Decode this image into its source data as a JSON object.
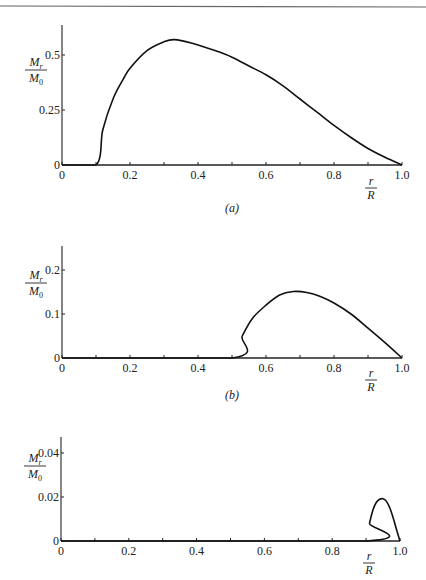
{
  "figure": {
    "top_rule": true,
    "ylabel_numerator": "M",
    "ylabel_numerator_sub": "r",
    "ylabel_denominator": "M",
    "ylabel_denominator_sub": "0",
    "xlabel_numerator": "r",
    "xlabel_denominator": "R"
  },
  "chart_data": [
    {
      "type": "line",
      "panel": "(a)",
      "title": "",
      "xlabel": "r/R",
      "ylabel": "M_r/M_0",
      "xlim": [
        0,
        1.0
      ],
      "ylim": [
        0,
        0.64
      ],
      "xticks": [
        0,
        0.2,
        0.4,
        0.6,
        0.8,
        1.0
      ],
      "xtick_labels": [
        "0",
        "0.2",
        "0.4",
        "0.6",
        "0.8",
        "1.0"
      ],
      "xminor_ticks": [
        0.1,
        0.3,
        0.5,
        0.7,
        0.9
      ],
      "yticks": [
        0,
        0.25,
        0.5
      ],
      "ytick_labels": [
        "0",
        "0.25",
        "0.5"
      ],
      "grid": false,
      "x": [
        0.0,
        0.1,
        0.12,
        0.15,
        0.18,
        0.2,
        0.25,
        0.3,
        0.33,
        0.38,
        0.45,
        0.5,
        0.55,
        0.6,
        0.65,
        0.7,
        0.75,
        0.8,
        0.85,
        0.9,
        0.95,
        1.0
      ],
      "values": [
        0.0,
        0.0,
        0.16,
        0.3,
        0.39,
        0.44,
        0.52,
        0.56,
        0.57,
        0.555,
        0.52,
        0.49,
        0.45,
        0.41,
        0.36,
        0.3,
        0.24,
        0.18,
        0.125,
        0.075,
        0.035,
        0.0
      ]
    },
    {
      "type": "line",
      "panel": "(b)",
      "title": "",
      "xlabel": "r/R",
      "ylabel": "M_r/M_0",
      "xlim": [
        0,
        1.0
      ],
      "ylim": [
        0,
        0.255
      ],
      "xticks": [
        0,
        0.2,
        0.4,
        0.6,
        0.8,
        1.0
      ],
      "xtick_labels": [
        "0",
        "0.2",
        "0.4",
        "0.6",
        "0.8",
        "1.0"
      ],
      "xminor_ticks": [
        0.1,
        0.3,
        0.5,
        0.7,
        0.9
      ],
      "yticks": [
        0,
        0.1,
        0.2
      ],
      "ytick_labels": [
        "0",
        "0.1",
        "0.2"
      ],
      "grid": false,
      "x": [
        0.0,
        0.5,
        0.53,
        0.56,
        0.6,
        0.64,
        0.68,
        0.72,
        0.76,
        0.8,
        0.85,
        0.9,
        0.95,
        1.0
      ],
      "values": [
        0.0,
        0.0,
        0.05,
        0.09,
        0.12,
        0.143,
        0.151,
        0.149,
        0.14,
        0.125,
        0.1,
        0.068,
        0.035,
        0.0
      ]
    },
    {
      "type": "line",
      "panel": "(c)",
      "title": "",
      "xlabel": "r/R",
      "ylabel": "M_r/M_0",
      "xlim": [
        0,
        1.0
      ],
      "ylim": [
        0,
        0.047
      ],
      "xticks": [
        0,
        0.2,
        0.4,
        0.6,
        0.8,
        1.0
      ],
      "xtick_labels": [
        "0",
        "0.2",
        "0.4",
        "0.6",
        "0.8",
        "1.0"
      ],
      "xminor_ticks": [
        0.1,
        0.3,
        0.5,
        0.7,
        0.9
      ],
      "yticks": [
        0,
        0.02,
        0.04
      ],
      "ytick_labels": [
        "0",
        "0.02",
        "0.04"
      ],
      "grid": false,
      "x": [
        0.0,
        0.9,
        0.91,
        0.92,
        0.93,
        0.94,
        0.95,
        0.96,
        0.97,
        0.98,
        0.99,
        1.0
      ],
      "values": [
        0.0,
        0.0,
        0.008,
        0.014,
        0.0175,
        0.019,
        0.0192,
        0.018,
        0.015,
        0.0105,
        0.005,
        0.0
      ]
    }
  ],
  "panels": [
    {
      "label": "(a)",
      "frame": {
        "x0": 62,
        "x1": 402,
        "y0": 165,
        "ytop": 25,
        "ppu_y": 220
      },
      "label_pos": {
        "x": 232,
        "y": 212
      },
      "ylabel_pos": {
        "x": 36,
        "y": 70
      },
      "xlabel_pos": {
        "x": 371,
        "y": 188
      }
    },
    {
      "label": "(b)",
      "frame": {
        "x0": 62,
        "x1": 402,
        "y0": 358,
        "ytop": 246,
        "ppu_y": 440
      },
      "label_pos": {
        "x": 232,
        "y": 399
      },
      "ylabel_pos": {
        "x": 36,
        "y": 283
      },
      "xlabel_pos": {
        "x": 371,
        "y": 380
      }
    },
    {
      "label": "",
      "frame": {
        "x0": 61,
        "x1": 400,
        "y0": 541,
        "ytop": 437,
        "ppu_y": 2200
      },
      "label_pos": null,
      "ylabel_pos": {
        "x": 35,
        "y": 466
      },
      "xlabel_pos": {
        "x": 369,
        "y": 563
      }
    }
  ]
}
